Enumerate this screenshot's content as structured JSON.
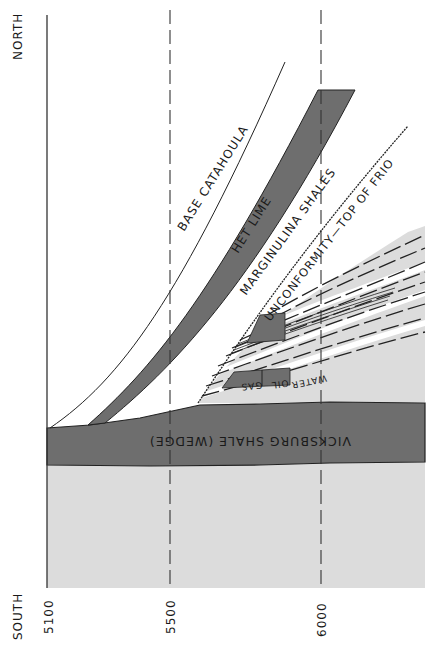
{
  "orientation": {
    "top": "NORTH",
    "bottom": "SOUTH"
  },
  "depth_axis": {
    "ticks": [
      "5100",
      "5500",
      "6000"
    ]
  },
  "formations": {
    "base_catahoula": "BASE CATAHOULA",
    "het_lime": "HET LIME",
    "marginulina": "MARGINULINA SHALES",
    "unconformity": "UNCONFORMITY—TOP OF FRIO",
    "vicksburg": "VICKSBURG SHALE (WEDGE)"
  },
  "reservoir_fluids": {
    "water": "WATER",
    "oil": "OIL",
    "gas": "GAS"
  },
  "colors": {
    "dark_fill": "#6e6e6e",
    "light_fill": "#dcdcdc",
    "line": "#222222",
    "background": "#ffffff"
  }
}
